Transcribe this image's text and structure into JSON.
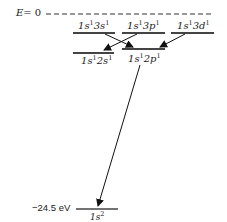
{
  "diagram": {
    "title": "",
    "zero_line": {
      "label_var": "E",
      "label_value": "= 0"
    },
    "ground_energy_label": "−24.5 eV",
    "levels": [
      {
        "id": "1s3s",
        "label_html": "1s¹3s¹",
        "parts": [
          "1",
          "s",
          "1",
          "3",
          "s",
          "1"
        ]
      },
      {
        "id": "1s3p",
        "parts": [
          "1",
          "s",
          "1",
          "3",
          "p",
          "1"
        ]
      },
      {
        "id": "1s3d",
        "parts": [
          "1",
          "s",
          "1",
          "3",
          "d",
          "1"
        ]
      },
      {
        "id": "1s2s",
        "parts": [
          "1",
          "s",
          "1",
          "2",
          "s",
          "1"
        ]
      },
      {
        "id": "1s2p",
        "parts": [
          "1",
          "s",
          "1",
          "2",
          "p",
          "1"
        ]
      },
      {
        "id": "1s2",
        "parts": [
          "1",
          "s",
          "2"
        ]
      }
    ],
    "transitions": [
      {
        "from": "1s3s",
        "to": "1s2p"
      },
      {
        "from": "1s3p",
        "to": "1s2s"
      },
      {
        "from": "1s3d",
        "to": "1s2p"
      },
      {
        "from": "1s2p",
        "to": "1s2"
      }
    ]
  }
}
